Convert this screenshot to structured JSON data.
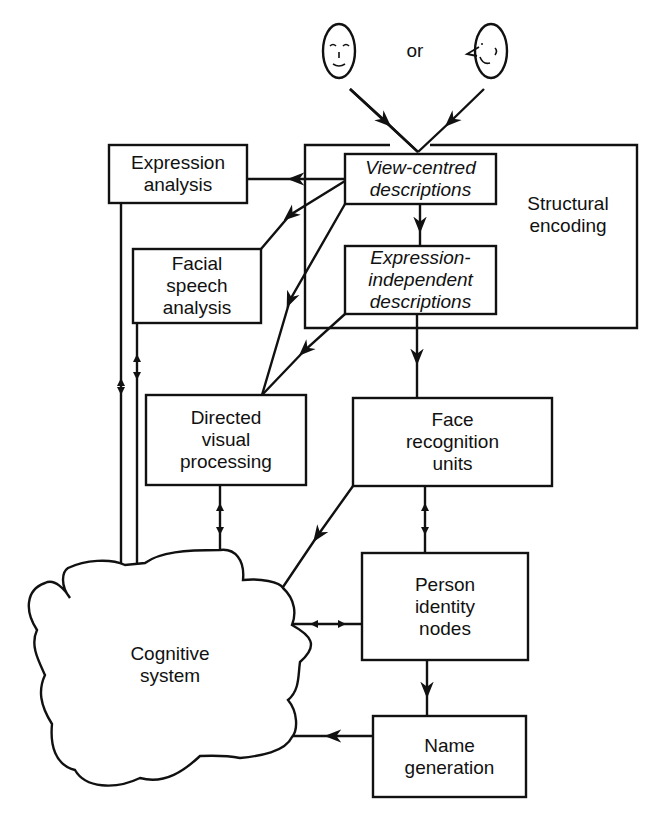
{
  "inputs": {
    "left_face": "frontal-face-icon",
    "connector": "or",
    "right_face": "profile-face-icon"
  },
  "nodes": {
    "structural_encoding": {
      "lines": [
        "Structural",
        "encoding"
      ]
    },
    "view_centred": {
      "lines": [
        "View-centred",
        "descriptions"
      ]
    },
    "expression_independent": {
      "lines": [
        "Expression-",
        "independent",
        "descriptions"
      ]
    },
    "expression_analysis": {
      "lines": [
        "Expression",
        "analysis"
      ]
    },
    "facial_speech": {
      "lines": [
        "Facial",
        "speech",
        "analysis"
      ]
    },
    "directed_visual": {
      "lines": [
        "Directed",
        "visual",
        "processing"
      ]
    },
    "face_recognition": {
      "lines": [
        "Face",
        "recognition",
        "units"
      ]
    },
    "person_identity": {
      "lines": [
        "Person",
        "identity",
        "nodes"
      ]
    },
    "name_generation": {
      "lines": [
        "Name",
        "generation"
      ]
    },
    "cognitive_system": {
      "lines": [
        "Cognitive",
        "system"
      ]
    }
  },
  "edges": [
    {
      "from": "frontal-face",
      "to": "view_centred",
      "type": "arrow"
    },
    {
      "from": "profile-face",
      "to": "view_centred",
      "type": "arrow"
    },
    {
      "from": "view_centred",
      "to": "expression_analysis",
      "type": "arrow"
    },
    {
      "from": "view_centred",
      "to": "facial_speech",
      "type": "arrow"
    },
    {
      "from": "view_centred",
      "to": "directed_visual",
      "type": "arrow"
    },
    {
      "from": "view_centred",
      "to": "expression_independent",
      "type": "arrow"
    },
    {
      "from": "expression_independent",
      "to": "directed_visual",
      "type": "arrow"
    },
    {
      "from": "expression_independent",
      "to": "face_recognition",
      "type": "arrow"
    },
    {
      "from": "expression_analysis",
      "to": "cognitive_system",
      "type": "bidirectional"
    },
    {
      "from": "facial_speech",
      "to": "cognitive_system",
      "type": "bidirectional"
    },
    {
      "from": "directed_visual",
      "to": "cognitive_system",
      "type": "bidirectional"
    },
    {
      "from": "face_recognition",
      "to": "cognitive_system",
      "type": "arrow"
    },
    {
      "from": "face_recognition",
      "to": "person_identity",
      "type": "bidirectional"
    },
    {
      "from": "person_identity",
      "to": "cognitive_system",
      "type": "bidirectional"
    },
    {
      "from": "person_identity",
      "to": "name_generation",
      "type": "arrow"
    },
    {
      "from": "name_generation",
      "to": "cognitive_system",
      "type": "arrow"
    }
  ],
  "style": {
    "stroke": "#111111",
    "background": "#ffffff"
  }
}
